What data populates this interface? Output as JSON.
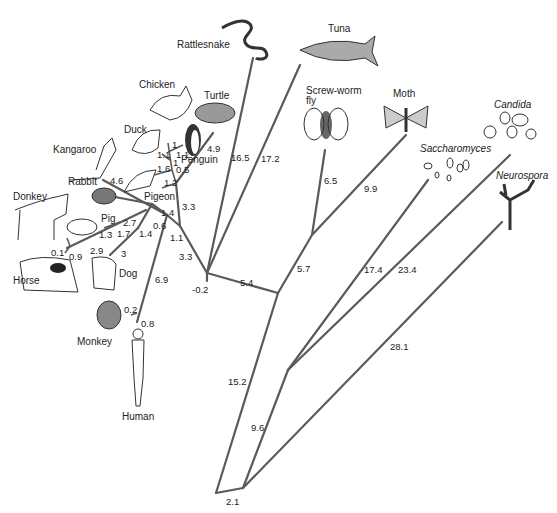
{
  "diagram": {
    "type": "phylogenetic-tree",
    "taxa": {
      "rattlesnake": "Rattlesnake",
      "tuna": "Tuna",
      "screwworm": "Screw-worm",
      "screwworm2": "fly",
      "moth": "Moth",
      "candida": "Candida",
      "saccharomyces": "Saccharomyces",
      "neurospora": "Neurospora",
      "chicken": "Chicken",
      "turtle": "Turtle",
      "duck": "Duck",
      "penguin": "Penguin",
      "kangaroo": "Kangaroo",
      "rabbit": "Rabbit",
      "pigeon": "Pigeon",
      "donkey": "Donkey",
      "pig": "Pig",
      "horse": "Horse",
      "dog": "Dog",
      "monkey": "Monkey",
      "human": "Human"
    },
    "branch_lengths": {
      "rattlesnake": "16.5",
      "tuna": "17.2",
      "screwworm": "6.5",
      "moth": "9.9",
      "insects_stem": "5.7",
      "animal_stem": "5.4",
      "saccharomyces": "17.4",
      "candida": "23.4",
      "neurospora": "28.1",
      "fungi_stem": "9.6",
      "animals_root": "15.2",
      "root": "2.1",
      "vertebrate_node": "-0.2",
      "birds_stem": "3.3",
      "mammal_stem": "3.3",
      "turtle": "4.9",
      "chicken": "1",
      "duck": "1.1",
      "penguin_a": "1.1",
      "penguin_b": "1",
      "bird_inner": "0.5",
      "pigeon_a": "1.6",
      "pigeon_b": "1.2",
      "kangaroo": "4.6",
      "rabbit_node": "1.4",
      "placental_a": "1.1",
      "mam_inner": "0.6",
      "pig": "2.7",
      "ungulate_a": "1.7",
      "ungulate_b": "1.4",
      "pig_branch": "1.3",
      "donkey": "0.1",
      "horse": "0.9",
      "horse_branch": "2.9",
      "dog": "3",
      "primate_stem": "6.9",
      "monkey": "0.2",
      "human": "0.8"
    }
  }
}
